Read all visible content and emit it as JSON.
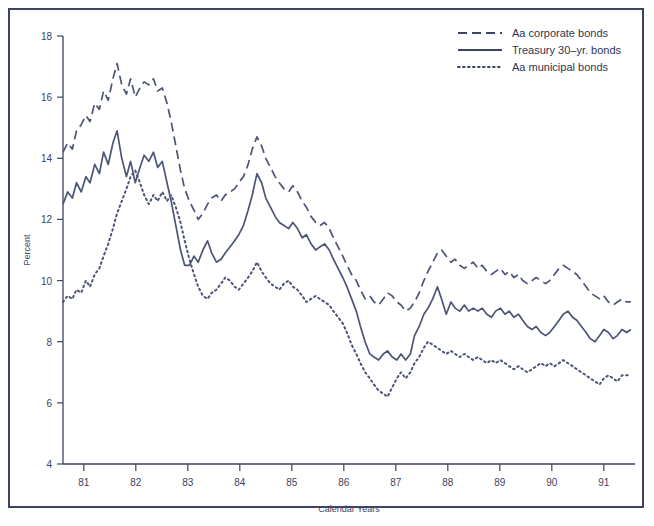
{
  "figure": {
    "background": "#ffffff",
    "frame_color": "#3c4363",
    "line_color": "#4c5577"
  },
  "axes": {
    "ylabel": "Percent",
    "xlabel": "Calendar Years",
    "yticks": [
      "4",
      "6",
      "8",
      "10",
      "12",
      "14",
      "16",
      "18"
    ],
    "xticks": [
      "81",
      "82",
      "83",
      "84",
      "85",
      "86",
      "87",
      "88",
      "89",
      "90",
      "91"
    ]
  },
  "legend": {
    "position": "top-right",
    "entries": [
      {
        "label": "Aa corporate bonds",
        "style": "dashed"
      },
      {
        "label": "Treasury 30–yr. bonds",
        "style": "solid"
      },
      {
        "label": "Aa municipal bonds",
        "style": "dotted"
      }
    ]
  },
  "chart_data": {
    "type": "line",
    "title": "",
    "subtitle": "",
    "xlabel": "Calendar Years",
    "ylabel": "Percent",
    "xlim": [
      80.6,
      91.6
    ],
    "ylim": [
      4,
      18
    ],
    "grid": false,
    "legend_position": "top-right",
    "xticks": [
      81,
      82,
      83,
      84,
      85,
      86,
      87,
      88,
      89,
      90,
      91
    ],
    "yticks": [
      4,
      6,
      8,
      10,
      12,
      14,
      16,
      18
    ],
    "x": [
      80.6,
      80.69,
      80.78,
      80.86,
      80.95,
      81.04,
      81.12,
      81.21,
      81.3,
      81.38,
      81.47,
      81.56,
      81.64,
      81.73,
      81.82,
      81.9,
      81.99,
      82.08,
      82.16,
      82.25,
      82.34,
      82.42,
      82.51,
      82.6,
      82.68,
      82.77,
      82.86,
      82.94,
      83.03,
      83.12,
      83.2,
      83.29,
      83.38,
      83.46,
      83.55,
      83.64,
      83.72,
      83.81,
      83.9,
      83.98,
      84.07,
      84.16,
      84.24,
      84.33,
      84.42,
      84.5,
      84.59,
      84.68,
      84.76,
      84.85,
      84.94,
      85.02,
      85.11,
      85.2,
      85.28,
      85.37,
      85.46,
      85.54,
      85.63,
      85.72,
      85.8,
      85.89,
      85.98,
      86.06,
      86.15,
      86.24,
      86.32,
      86.41,
      86.5,
      86.58,
      86.67,
      86.76,
      86.84,
      86.93,
      87.02,
      87.1,
      87.19,
      87.28,
      87.36,
      87.45,
      87.54,
      87.62,
      87.71,
      87.8,
      87.88,
      87.97,
      88.06,
      88.14,
      88.23,
      88.32,
      88.4,
      88.49,
      88.58,
      88.66,
      88.75,
      88.84,
      88.92,
      89.01,
      89.1,
      89.18,
      89.27,
      89.36,
      89.44,
      89.53,
      89.62,
      89.7,
      89.79,
      89.88,
      89.96,
      90.05,
      90.14,
      90.22,
      90.31,
      90.4,
      90.48,
      90.57,
      90.66,
      90.74,
      90.83,
      90.92,
      91.0,
      91.09,
      91.18,
      91.26,
      91.35,
      91.44,
      91.52
    ],
    "series": [
      {
        "name": "Aa corporate bonds",
        "style": "dashed",
        "color": "#4c5577",
        "values": [
          14.2,
          14.5,
          14.3,
          14.9,
          15.1,
          15.4,
          15.2,
          15.8,
          15.6,
          16.2,
          15.9,
          16.6,
          17.1,
          16.4,
          16.1,
          16.6,
          16.0,
          16.3,
          16.5,
          16.4,
          16.6,
          16.2,
          16.3,
          15.8,
          15.2,
          14.4,
          13.6,
          13.0,
          12.6,
          12.3,
          12.0,
          12.2,
          12.5,
          12.7,
          12.8,
          12.6,
          12.8,
          12.9,
          13.0,
          13.2,
          13.4,
          13.8,
          14.3,
          14.7,
          14.4,
          14.0,
          13.7,
          13.4,
          13.2,
          13.0,
          12.9,
          13.1,
          12.9,
          12.6,
          12.4,
          12.1,
          11.9,
          11.8,
          11.9,
          11.7,
          11.4,
          11.1,
          10.8,
          10.5,
          10.2,
          10.0,
          9.7,
          9.4,
          9.5,
          9.3,
          9.2,
          9.4,
          9.6,
          9.5,
          9.3,
          9.2,
          9.0,
          9.1,
          9.3,
          9.6,
          10.0,
          10.3,
          10.6,
          10.9,
          11.0,
          10.8,
          10.6,
          10.7,
          10.5,
          10.4,
          10.5,
          10.6,
          10.4,
          10.5,
          10.3,
          10.2,
          10.3,
          10.4,
          10.2,
          10.3,
          10.1,
          10.2,
          10.0,
          9.9,
          10.0,
          10.1,
          10.0,
          9.9,
          10.0,
          10.2,
          10.4,
          10.5,
          10.4,
          10.3,
          10.2,
          10.0,
          9.8,
          9.6,
          9.5,
          9.4,
          9.5,
          9.3,
          9.2,
          9.3,
          9.4,
          9.3,
          9.3
        ]
      },
      {
        "name": "Treasury 30–yr. bonds",
        "style": "solid",
        "color": "#4c5577",
        "values": [
          12.5,
          12.9,
          12.7,
          13.2,
          12.9,
          13.4,
          13.2,
          13.8,
          13.5,
          14.2,
          13.8,
          14.5,
          14.9,
          14.0,
          13.4,
          13.9,
          13.2,
          13.7,
          14.1,
          13.9,
          14.2,
          13.7,
          13.9,
          13.2,
          12.6,
          11.8,
          11.0,
          10.5,
          10.5,
          10.8,
          10.6,
          11.0,
          11.3,
          10.9,
          10.6,
          10.7,
          10.9,
          11.1,
          11.3,
          11.5,
          11.8,
          12.3,
          12.8,
          13.5,
          13.2,
          12.7,
          12.4,
          12.1,
          11.9,
          11.8,
          11.7,
          11.9,
          11.7,
          11.4,
          11.5,
          11.2,
          11.0,
          11.1,
          11.2,
          11.0,
          10.7,
          10.4,
          10.1,
          9.8,
          9.4,
          9.0,
          8.5,
          8.0,
          7.6,
          7.5,
          7.4,
          7.6,
          7.7,
          7.5,
          7.4,
          7.6,
          7.4,
          7.6,
          8.2,
          8.5,
          8.9,
          9.1,
          9.4,
          9.8,
          9.4,
          8.9,
          9.3,
          9.1,
          9.0,
          9.2,
          9.0,
          9.1,
          9.0,
          9.1,
          8.9,
          8.8,
          9.0,
          9.1,
          8.9,
          9.0,
          8.8,
          8.9,
          8.7,
          8.5,
          8.4,
          8.5,
          8.3,
          8.2,
          8.3,
          8.5,
          8.7,
          8.9,
          9.0,
          8.8,
          8.7,
          8.5,
          8.3,
          8.1,
          8.0,
          8.2,
          8.4,
          8.3,
          8.1,
          8.2,
          8.4,
          8.3,
          8.4
        ]
      },
      {
        "name": "Aa municipal bonds",
        "style": "dotted",
        "color": "#4c5577",
        "values": [
          9.3,
          9.5,
          9.4,
          9.7,
          9.6,
          10.0,
          9.8,
          10.2,
          10.4,
          10.8,
          11.2,
          11.7,
          12.2,
          12.6,
          13.0,
          13.4,
          13.6,
          13.2,
          12.8,
          12.5,
          12.8,
          12.6,
          12.9,
          12.6,
          12.8,
          12.4,
          11.9,
          11.3,
          10.7,
          10.2,
          9.8,
          9.5,
          9.4,
          9.6,
          9.7,
          9.9,
          10.1,
          10.0,
          9.8,
          9.7,
          9.9,
          10.1,
          10.3,
          10.6,
          10.3,
          10.1,
          9.9,
          9.8,
          9.7,
          9.9,
          10.0,
          9.8,
          9.7,
          9.5,
          9.3,
          9.4,
          9.5,
          9.4,
          9.3,
          9.2,
          9.0,
          8.8,
          8.6,
          8.3,
          7.9,
          7.6,
          7.3,
          7.0,
          6.8,
          6.6,
          6.4,
          6.3,
          6.2,
          6.5,
          6.8,
          7.0,
          6.8,
          7.0,
          7.3,
          7.5,
          7.8,
          8.0,
          7.9,
          7.8,
          7.7,
          7.6,
          7.7,
          7.6,
          7.5,
          7.6,
          7.5,
          7.4,
          7.5,
          7.4,
          7.3,
          7.4,
          7.3,
          7.4,
          7.3,
          7.2,
          7.1,
          7.2,
          7.1,
          7.0,
          7.1,
          7.2,
          7.3,
          7.2,
          7.3,
          7.2,
          7.3,
          7.4,
          7.3,
          7.2,
          7.1,
          7.0,
          6.9,
          6.8,
          6.7,
          6.6,
          6.8,
          6.9,
          6.8,
          6.7,
          6.9,
          6.9,
          6.9
        ]
      }
    ]
  }
}
